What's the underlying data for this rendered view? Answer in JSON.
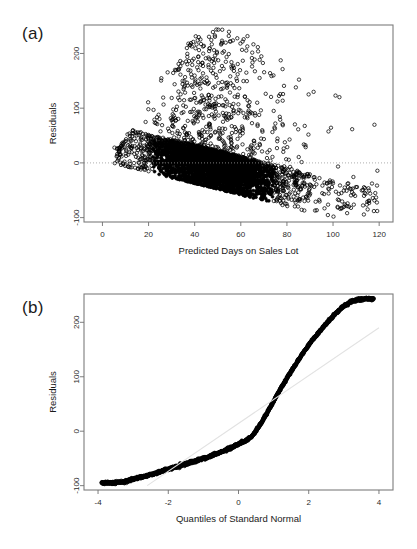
{
  "figure": {
    "background": "#ffffff",
    "point_color": "#000000",
    "axis_color": "#7d7d7d",
    "reference_line_color": "#e2e2e2",
    "zero_line_color": "#9a9a9a"
  },
  "panels": [
    {
      "id": "a",
      "label": "(a)"
    },
    {
      "id": "b",
      "label": "(b)"
    }
  ],
  "chart_data": [
    {
      "type": "scatter",
      "panel": "(a)",
      "title": "",
      "xlabel": "Predicted Days on Sales Lot",
      "ylabel": "Residuals",
      "xlim": [
        -8,
        126
      ],
      "ylim": [
        -108,
        252
      ],
      "xticks": [
        0,
        20,
        40,
        60,
        80,
        100,
        120
      ],
      "xticklabels": [
        "0",
        "20",
        "40",
        "60",
        "80",
        "100",
        "120"
      ],
      "yticks": [
        -100,
        0,
        100,
        200
      ],
      "yticklabels": [
        "-100",
        "0",
        "100",
        "200"
      ],
      "grid": false,
      "legend": "none",
      "annotations": [
        {
          "kind": "horizontal-reference-line",
          "y": 0,
          "style": "dotted",
          "color": "#9a9a9a"
        }
      ],
      "marker": "open-circle",
      "n_points": 4200,
      "description": "Residuals versus predicted days on sales lot. Dense wedge-shaped cloud with a sharp straight lower boundary rising from about (8, -5) to (100, -100), reflecting the non-negative censoring of observed days. Upper spread fans out to roughly +240 near predicted values of 40-60, then narrows. Sparse outlying circles extend right to predicted day 120.",
      "series": [
        {
          "name": "residuals",
          "x_range": [
            -4,
            120
          ],
          "y_range": [
            -100,
            245
          ],
          "density_peak_x": 48,
          "lower_boundary": {
            "x0": 8,
            "y0": -4,
            "x1": 100,
            "y1": -100
          },
          "upper_envelope": [
            {
              "x": 0,
              "y": 10
            },
            {
              "x": 10,
              "y": 45
            },
            {
              "x": 20,
              "y": 130
            },
            {
              "x": 30,
              "y": 175
            },
            {
              "x": 40,
              "y": 235
            },
            {
              "x": 50,
              "y": 245
            },
            {
              "x": 60,
              "y": 240
            },
            {
              "x": 70,
              "y": 215
            },
            {
              "x": 80,
              "y": 190
            },
            {
              "x": 90,
              "y": 150
            },
            {
              "x": 100,
              "y": 140
            },
            {
              "x": 110,
              "y": 145
            },
            {
              "x": 120,
              "y": 105
            }
          ]
        }
      ]
    },
    {
      "type": "scatter",
      "panel": "(b)",
      "title": "",
      "xlabel": "Quantiles of Standard Normal",
      "ylabel": "Residuals",
      "xlim": [
        -4.4,
        4.4
      ],
      "ylim": [
        -108,
        252
      ],
      "xticks": [
        -4,
        -2,
        0,
        2,
        4
      ],
      "xticklabels": [
        "-4",
        "-2",
        "0",
        "2",
        "4"
      ],
      "yticks": [
        -100,
        0,
        100,
        200
      ],
      "yticklabels": [
        "-100",
        "0",
        "100",
        "200"
      ],
      "grid": false,
      "legend": "none",
      "marker": "open-circle",
      "n_points": 1400,
      "annotations": [
        {
          "kind": "qq-reference-line",
          "style": "solid",
          "color": "#e2e2e2",
          "p1": {
            "x": -2.6,
            "y": -100
          },
          "p2": {
            "x": 4.0,
            "y": 190
          }
        }
      ],
      "description": "Normal quantile-quantile plot of residuals. The point trace is S-shaped: it sits above the reference line in the lower-left tail, crosses near the middle with a flat shoulder around y = -20, then rises steeply above the line on the right, flattening near +240 at the far upper tail. Individual open circles separate at both extremes.",
      "series": [
        {
          "name": "residual-quantiles",
          "curve": [
            {
              "q": -3.9,
              "y": -95
            },
            {
              "q": -3.6,
              "y": -95
            },
            {
              "q": -3.4,
              "y": -94
            },
            {
              "q": -3.2,
              "y": -92
            },
            {
              "q": -3.0,
              "y": -88
            },
            {
              "q": -2.6,
              "y": -82
            },
            {
              "q": -2.2,
              "y": -74
            },
            {
              "q": -1.8,
              "y": -66
            },
            {
              "q": -1.4,
              "y": -58
            },
            {
              "q": -1.0,
              "y": -50
            },
            {
              "q": -0.6,
              "y": -41
            },
            {
              "q": -0.3,
              "y": -33
            },
            {
              "q": 0.0,
              "y": -24
            },
            {
              "q": 0.2,
              "y": -18
            },
            {
              "q": 0.4,
              "y": -8
            },
            {
              "q": 0.6,
              "y": 10
            },
            {
              "q": 0.8,
              "y": 32
            },
            {
              "q": 1.0,
              "y": 55
            },
            {
              "q": 1.2,
              "y": 78
            },
            {
              "q": 1.4,
              "y": 100
            },
            {
              "q": 1.6,
              "y": 120
            },
            {
              "q": 1.8,
              "y": 140
            },
            {
              "q": 2.0,
              "y": 158
            },
            {
              "q": 2.2,
              "y": 175
            },
            {
              "q": 2.4,
              "y": 190
            },
            {
              "q": 2.6,
              "y": 205
            },
            {
              "q": 2.8,
              "y": 218
            },
            {
              "q": 3.0,
              "y": 230
            },
            {
              "q": 3.2,
              "y": 238
            },
            {
              "q": 3.4,
              "y": 242
            },
            {
              "q": 3.6,
              "y": 243
            },
            {
              "q": 3.85,
              "y": 243
            }
          ]
        }
      ]
    }
  ]
}
